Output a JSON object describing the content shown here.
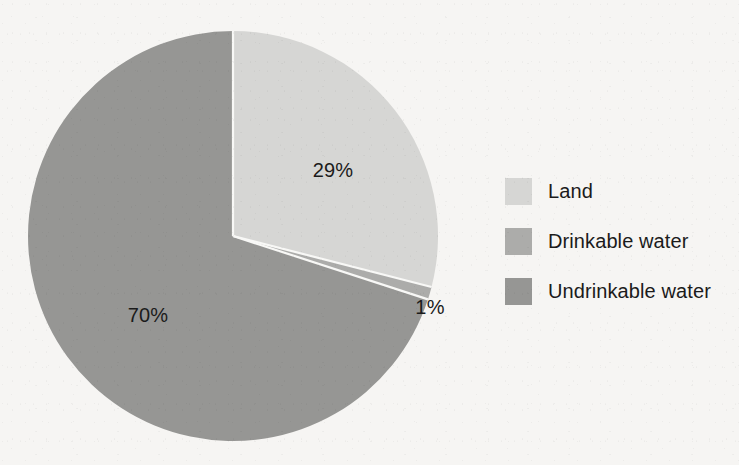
{
  "chart_data": {
    "type": "pie",
    "title": "",
    "subtitle": "",
    "xlabel": "",
    "ylabel": "",
    "grid": false,
    "legend_position": "right",
    "start_angle_deg": 0,
    "direction": "clockwise",
    "categories": [
      "Land",
      "Drinkable water",
      "Undrinkable water"
    ],
    "values": [
      29,
      1,
      70
    ],
    "value_labels": [
      "29%",
      "1%",
      "70%"
    ],
    "value_unit": "%",
    "colors": [
      "#d6d6d4",
      "#acacaa",
      "#969694"
    ],
    "slices": [
      {
        "label": "Land",
        "value": 29,
        "value_label": "29%",
        "color": "#d6d6d4",
        "label_position": "inside"
      },
      {
        "label": "Drinkable water",
        "value": 1,
        "value_label": "1%",
        "color": "#acacaa",
        "label_position": "outside"
      },
      {
        "label": "Undrinkable water",
        "value": 70,
        "value_label": "70%",
        "color": "#969694",
        "label_position": "inside"
      }
    ]
  },
  "legend": {
    "items": [
      {
        "label": "Land",
        "color": "#d6d6d4"
      },
      {
        "label": "Drinkable water",
        "color": "#acacaa"
      },
      {
        "label": "Undrinkable water",
        "color": "#969694"
      }
    ]
  },
  "labels": {
    "land_pct": "29%",
    "drinkable_pct": "1%",
    "undrinkable_pct": "70%"
  },
  "style": {
    "background": "#f6f5f3",
    "separator": "#f8f8f6",
    "text": "#1b1b1b"
  }
}
